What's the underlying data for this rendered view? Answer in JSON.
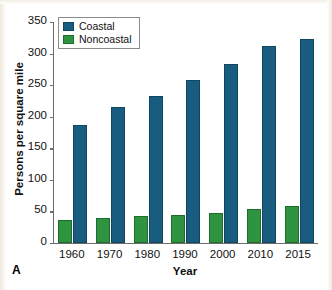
{
  "panel": {
    "label": "A"
  },
  "legend": {
    "position": "top-left",
    "entries": [
      {
        "label": "Coastal",
        "color": "#185c80"
      },
      {
        "label": "Noncoastal",
        "color": "#2e9440"
      }
    ]
  },
  "axes": {
    "y_title": "Persons per square mile",
    "x_title": "Year",
    "y_ticks": [
      "350",
      "300",
      "250",
      "200",
      "150",
      "100",
      "50",
      "0"
    ],
    "x_ticks": [
      "1960",
      "1970",
      "1980",
      "1990",
      "2000",
      "2010",
      "2015"
    ]
  },
  "chart_data": {
    "type": "bar",
    "title": "",
    "xlabel": "Year",
    "ylabel": "Persons per square mile",
    "ylim": [
      0,
      350
    ],
    "ytick_step": 50,
    "grid": false,
    "legend_position": "top-left",
    "categories": [
      "1960",
      "1970",
      "1980",
      "1990",
      "2000",
      "2010",
      "2015"
    ],
    "series": [
      {
        "name": "Noncoastal",
        "color": "#2e9440",
        "values": [
          36,
          39,
          42,
          45,
          48,
          54,
          59
        ]
      },
      {
        "name": "Coastal",
        "color": "#185c80",
        "values": [
          187,
          216,
          233,
          258,
          283,
          312,
          323
        ]
      }
    ]
  }
}
